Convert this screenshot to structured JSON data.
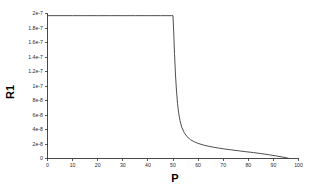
{
  "chart_data": {
    "type": "line",
    "title": "",
    "subtitle": "",
    "xlabel": "P",
    "ylabel": "R1",
    "xlim": [
      0,
      100
    ],
    "ylim": [
      0,
      2e-07
    ],
    "grid": false,
    "legend": null,
    "legend_position": "none",
    "background_color": "#ffffff",
    "line_color": "#3a3a3a",
    "axis_color": "#333333",
    "xticks": [
      0,
      10,
      20,
      30,
      40,
      50,
      60,
      70,
      80,
      90,
      100
    ],
    "xtick_labels": [
      "0",
      "10",
      "20",
      "30",
      "40",
      "50",
      "60",
      "70",
      "80",
      "90",
      "100"
    ],
    "yticks": [
      0,
      2e-08,
      4e-08,
      6e-08,
      8e-08,
      1e-07,
      1.2e-07,
      1.4e-07,
      1.6e-07,
      1.8e-07,
      2e-07
    ],
    "ytick_labels": [
      "0",
      "2e-8",
      "4e-8",
      "6e-8",
      "8e-8",
      "1e-7",
      "1.2e-7",
      "1.4e-7",
      "1.6e-7",
      "1.8e-7",
      "2e-7"
    ],
    "series": [
      {
        "name": "R1",
        "x": [
          0,
          5,
          10,
          15,
          20,
          25,
          30,
          35,
          40,
          45,
          48,
          49.5,
          50,
          50.3,
          50.6,
          51,
          51.4,
          51.8,
          52.2,
          52.8,
          53.5,
          54.5,
          55.5,
          57,
          58.5,
          60,
          62,
          64,
          66,
          68,
          70,
          73,
          76,
          79,
          82,
          85,
          88,
          91,
          93.5,
          95,
          96
        ],
        "y": [
          1.97e-07,
          1.97e-07,
          1.97e-07,
          1.97e-07,
          1.97e-07,
          1.97e-07,
          1.97e-07,
          1.97e-07,
          1.97e-07,
          1.97e-07,
          1.97e-07,
          1.97e-07,
          1.97e-07,
          1.72e-07,
          1.45e-07,
          1.15e-07,
          9.3e-08,
          7.6e-08,
          6.4e-08,
          5.2e-08,
          4.3e-08,
          3.55e-08,
          3.05e-08,
          2.58e-08,
          2.3e-08,
          2.08e-08,
          1.87e-08,
          1.7e-08,
          1.57e-08,
          1.45e-08,
          1.34e-08,
          1.2e-08,
          1.07e-08,
          9.4e-09,
          8.2e-09,
          6.8e-09,
          5.3e-09,
          3.6e-09,
          2.1e-09,
          1.1e-09,
          2e-10
        ]
      }
    ]
  },
  "axis_titles": {
    "y": "R1",
    "x": "P"
  }
}
